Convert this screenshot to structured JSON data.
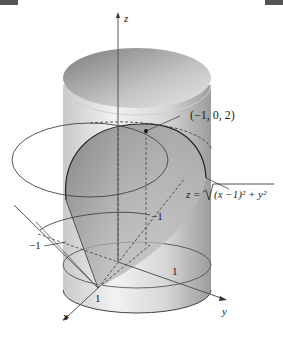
{
  "figure": {
    "type": "3d-surface-diagram",
    "description_shapes": [
      "cylinder",
      "cone"
    ],
    "axes": {
      "x_label": "x",
      "y_label": "y",
      "z_label": "z"
    },
    "tick_labels": {
      "x_one": "1",
      "y_one": "1",
      "neg_one_left": "−1",
      "neg_one_inner": "−1"
    },
    "point_label": "(−1, 0, 2)",
    "surface_equation": {
      "lhs": "z = ",
      "radicand": "(x −1)² + y²"
    },
    "colors": {
      "cylinder_light": "#e8e8e8",
      "cylinder_dark": "#9a9a9a",
      "cone_fill": "#8c8c8c",
      "line": "#333333",
      "axis": "#555555"
    }
  }
}
